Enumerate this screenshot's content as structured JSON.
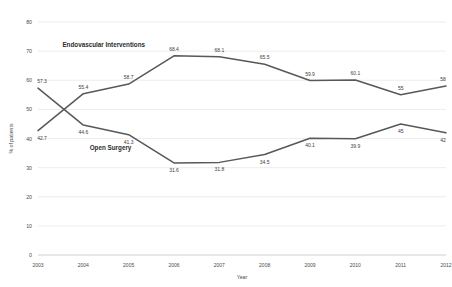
{
  "chart_data": {
    "type": "line",
    "title": "",
    "xlabel": "Year",
    "ylabel": "% of patients",
    "categories": [
      "2003",
      "2004",
      "2005",
      "2006",
      "2007",
      "2008",
      "2009",
      "2010",
      "2011",
      "2012"
    ],
    "ylim": [
      0,
      80
    ],
    "yticks": [
      0,
      10,
      20,
      30,
      40,
      50,
      60,
      70,
      80
    ],
    "grid": true,
    "legend_position": "inline-annotation",
    "line_color": "#585858",
    "series": [
      {
        "name": "Endovascular Interventions",
        "values": [
          42.7,
          55.4,
          58.7,
          68.4,
          68.1,
          65.5,
          59.9,
          60.1,
          55,
          58
        ],
        "labels": [
          "42.7",
          "55.4",
          "58.7",
          "68.4",
          "68.1",
          "65.5",
          "59.9",
          "60.1",
          "55",
          "58"
        ]
      },
      {
        "name": "Open Surgery",
        "values": [
          57.3,
          44.6,
          41.3,
          31.6,
          31.8,
          34.5,
          40.1,
          39.9,
          45,
          42
        ],
        "labels": [
          "57.3",
          "44.6",
          "41.3",
          "31.6",
          "31.8",
          "34.5",
          "40.1",
          "39.9",
          "45",
          "42"
        ]
      }
    ],
    "annotations": [
      {
        "text": "Endovascular Interventions",
        "x": 2004.45,
        "y": 71.5
      },
      {
        "text": "Open Surgery",
        "x": 2004.6,
        "y": 36.2
      }
    ]
  },
  "ytick_labels": [
    "80",
    "70",
    "60",
    "50",
    "40",
    "30",
    "20",
    "10",
    "0"
  ]
}
